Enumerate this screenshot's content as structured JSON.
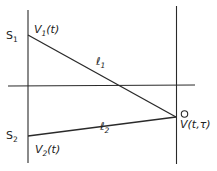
{
  "diagram": {
    "type": "geometry",
    "sources": [
      {
        "name": "S",
        "subscript": "1",
        "signal_main": "V",
        "signal_sub": "1",
        "signal_arg": "(t)"
      },
      {
        "name": "S",
        "subscript": "2",
        "signal_main": "V",
        "signal_sub": "2",
        "signal_arg": "(t)"
      }
    ],
    "paths": [
      {
        "label": "ℓ",
        "subscript": "1"
      },
      {
        "label": "ℓ",
        "subscript": "2"
      }
    ],
    "receiver": {
      "label": "V(t,τ)",
      "marker": "open-circle"
    },
    "colors": {
      "line": "#2a2a2a",
      "background": "#ffffff"
    }
  }
}
